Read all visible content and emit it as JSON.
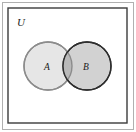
{
  "figure": {
    "type": "venn-diagram",
    "title": "",
    "background_color": "#ffffff"
  },
  "universe": {
    "label": "U",
    "border_color": "#3b3b3b",
    "fill_color": "#ffffff",
    "x": 8,
    "y": 8,
    "width": 119,
    "height": 115,
    "label_x": 17,
    "label_y": 26
  },
  "sets": [
    {
      "name": "set-a",
      "label": "A",
      "fill_color": "#e6e6e6",
      "stroke_color": "#8c8c8c",
      "cx": 48,
      "cy": 66,
      "r": 24,
      "label_x": 44,
      "label_y": 70
    },
    {
      "name": "set-b",
      "label": "B",
      "fill_color": "#d2d2d2",
      "stroke_color": "#2e2e2e",
      "cx": 87,
      "cy": 66,
      "r": 24,
      "label_x": 83,
      "label_y": 70
    }
  ],
  "intersection": {
    "name": "a-intersect-b",
    "label": "",
    "fill_color": "#b9b9b9"
  },
  "outer_frame": {
    "border_color": "#b0b0b0"
  }
}
